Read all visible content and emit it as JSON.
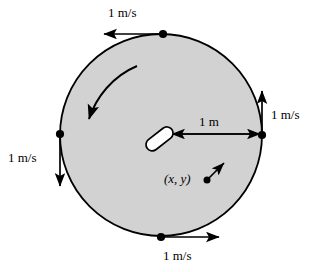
{
  "figure": {
    "colors": {
      "disc_fill": "#d2d2d2",
      "stroke": "#000000",
      "background": "#ffffff",
      "body_fill": "#ffffff"
    },
    "disc": {
      "center_x": 161,
      "center_y": 135,
      "radius": 101
    },
    "labels": {
      "top_speed": "1 m/s",
      "right_speed": "1 m/s",
      "left_speed": "1 m/s",
      "bottom_speed": "1 m/s",
      "radius": "1 m",
      "point": "(x, y)"
    },
    "markers": [
      {
        "name": "top-rim-point",
        "x": 163,
        "y": 34
      },
      {
        "name": "right-rim-point",
        "x": 262,
        "y": 135
      },
      {
        "name": "left-rim-point",
        "x": 60,
        "y": 134
      },
      {
        "name": "bottom-rim-point",
        "x": 161,
        "y": 237
      },
      {
        "name": "xy-point",
        "x": 207,
        "y": 180
      }
    ],
    "vectors": [
      {
        "name": "top-velocity-arrow",
        "direction": "left",
        "magnitude": "1 m/s"
      },
      {
        "name": "right-velocity-arrow",
        "direction": "up",
        "magnitude": "1 m/s"
      },
      {
        "name": "left-velocity-arrow",
        "direction": "down",
        "magnitude": "1 m/s"
      },
      {
        "name": "bottom-velocity-arrow",
        "direction": "right",
        "magnitude": "1 m/s"
      },
      {
        "name": "xy-velocity-arrow",
        "direction": "up-right",
        "magnitude": ""
      }
    ],
    "rotation": {
      "name": "rotation-arrow",
      "sense": "counterclockwise"
    }
  }
}
